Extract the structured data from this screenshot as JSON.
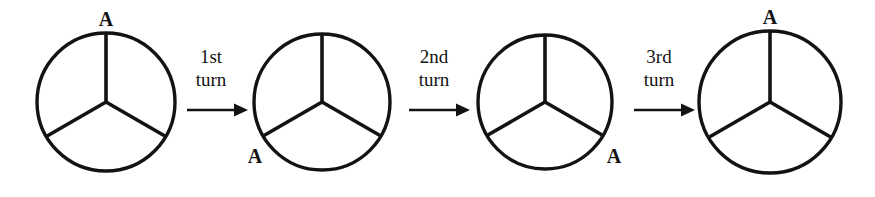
{
  "figure": {
    "background_color": "#ffffff",
    "ink_color": "#131313",
    "width": 875,
    "height": 197,
    "vertex_label": "A",
    "sectors_per_circle": 3,
    "spoke_angles_deg": [
      90,
      210,
      330
    ],
    "circles": [
      {
        "id": "circle-1",
        "order": 1,
        "cx": 106,
        "cy": 102,
        "r": 69,
        "label": "A",
        "label_angle_deg": 90,
        "label_position": "top",
        "label_x": 106,
        "label_y": 25
      },
      {
        "id": "circle-2",
        "order": 2,
        "cx": 322,
        "cy": 102,
        "r": 68,
        "label": "A",
        "label_angle_deg": 210,
        "label_position": "lower-left",
        "label_x": 258,
        "label_y": 160
      },
      {
        "id": "circle-3",
        "order": 3,
        "cx": 545,
        "cy": 102,
        "r": 67,
        "label": "A",
        "label_angle_deg": 330,
        "label_position": "lower-right",
        "label_x": 607,
        "label_y": 160
      },
      {
        "id": "circle-4",
        "order": 4,
        "cx": 770,
        "cy": 102,
        "r": 71,
        "label": "A",
        "label_angle_deg": 90,
        "label_position": "top",
        "label_x": 770,
        "label_y": 22
      }
    ],
    "transitions": [
      {
        "id": "transition-1",
        "label_line1": "1st",
        "label_line2": "turn",
        "label_x": 211,
        "label_line1_y": 63,
        "label_line2_y": 86,
        "arrow_x1": 187,
        "arrow_x2": 245,
        "arrow_y": 110
      },
      {
        "id": "transition-2",
        "label_line1": "2nd",
        "label_line2": "turn",
        "label_x": 434,
        "label_line1_y": 63,
        "label_line2_y": 86,
        "arrow_x1": 409,
        "arrow_x2": 467,
        "arrow_y": 110
      },
      {
        "id": "transition-3",
        "label_line1": "3rd",
        "label_line2": "turn",
        "label_x": 659,
        "label_line1_y": 63,
        "label_line2_y": 86,
        "arrow_x1": 634,
        "arrow_x2": 692,
        "arrow_y": 110
      }
    ]
  }
}
